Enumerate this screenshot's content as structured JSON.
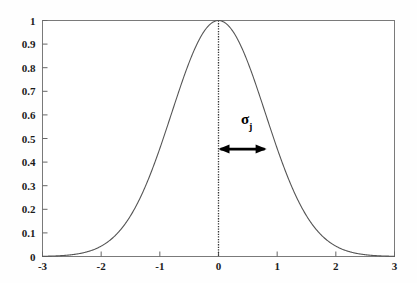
{
  "chart_data": {
    "type": "line",
    "title": "",
    "xlabel": "",
    "ylabel": "",
    "xlim": [
      -3,
      3
    ],
    "ylim": [
      0,
      1
    ],
    "grid": false,
    "legend": null,
    "curve": {
      "name": "gaussian",
      "formula": "exp(-x^2 / (2 * 0.8^2))",
      "mu": 0,
      "sigma": 0.8,
      "peak": 1,
      "color": "#555555",
      "x": [
        -3,
        -2.8,
        -2.6,
        -2.4,
        -2.2,
        -2,
        -1.8,
        -1.6,
        -1.4,
        -1.2,
        -1,
        -0.8,
        -0.6,
        -0.4,
        -0.2,
        0,
        0.2,
        0.4,
        0.6,
        0.8,
        1,
        1.2,
        1.4,
        1.6,
        1.8,
        2,
        2.2,
        2.4,
        2.6,
        2.8,
        3
      ],
      "y": [
        0.00885,
        0.0216,
        0.0048,
        0.0111,
        0.0235,
        0.0439,
        0.0796,
        0.1353,
        0.2163,
        0.3247,
        0.4578,
        0.6065,
        0.7548,
        0.8825,
        0.9692,
        1,
        0.9692,
        0.8825,
        0.7548,
        0.6065,
        0.4578,
        0.3247,
        0.2163,
        0.1353,
        0.0796,
        0.0439,
        0.0235,
        0.0111,
        0.0048,
        0.0019,
        0.0007
      ]
    },
    "xticks": [
      "-3",
      "-2",
      "-1",
      "0",
      "1",
      "2",
      "3"
    ],
    "xtick_values": [
      -3,
      -2,
      -1,
      0,
      1,
      2,
      3
    ],
    "yticks": [
      "0",
      "0.1",
      "0.2",
      "0.3",
      "0.4",
      "0.5",
      "0.6",
      "0.7",
      "0.8",
      "0.9",
      "1"
    ],
    "ytick_values": [
      0,
      0.1,
      0.2,
      0.3,
      0.4,
      0.5,
      0.6,
      0.7,
      0.8,
      0.9,
      1
    ],
    "annotations": [
      {
        "kind": "vertical-dotted-line",
        "x": 0,
        "y_from": 0,
        "y_to": 1,
        "color": "#333333"
      },
      {
        "kind": "double-headed-arrow",
        "x_from": 0,
        "x_to": 0.82,
        "y": 0.455,
        "color": "#000000"
      },
      {
        "kind": "text",
        "label": "σ",
        "subscript": "j",
        "x": 0.45,
        "y": 0.58
      }
    ]
  },
  "axis": {
    "frame_color": "#7a7a7a",
    "tick_color": "#555555"
  }
}
